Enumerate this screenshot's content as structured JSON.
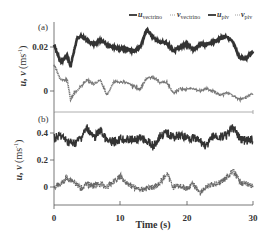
{
  "chart_data": [
    {
      "panel": "(a)",
      "type": "line",
      "title": "",
      "xlabel": "",
      "ylabel": "u, v (ms^-1)",
      "xlim": [
        0,
        30
      ],
      "ylim": [
        -0.01,
        0.037
      ],
      "yticks": [
        0,
        0.02
      ],
      "ytick_labels": [
        "0",
        "0.02"
      ],
      "legend": [
        {
          "name": "u_vectrino",
          "style": "solid-dark"
        },
        {
          "name": "v_vectrino",
          "style": "dotted-light"
        },
        {
          "name": "u_piv",
          "style": "solid-dark"
        },
        {
          "name": "v_piv",
          "style": "dotted-light"
        }
      ],
      "legend_position": "top-right",
      "series": [
        {
          "name": "u",
          "x": [
            0,
            1,
            2,
            2.5,
            3,
            3.5,
            4,
            5,
            6,
            7,
            8,
            9,
            10,
            11,
            12,
            13,
            14,
            15,
            16,
            17,
            18,
            19,
            20,
            21,
            22,
            23,
            24,
            25,
            26,
            27,
            28,
            29,
            30
          ],
          "values": [
            0.021,
            0.013,
            0.016,
            0.011,
            0.018,
            0.024,
            0.025,
            0.023,
            0.021,
            0.023,
            0.021,
            0.02,
            0.019,
            0.019,
            0.018,
            0.02,
            0.028,
            0.024,
            0.022,
            0.022,
            0.018,
            0.02,
            0.021,
            0.019,
            0.021,
            0.021,
            0.022,
            0.024,
            0.025,
            0.022,
            0.015,
            0.015,
            0.018
          ]
        },
        {
          "name": "v",
          "x": [
            0,
            1,
            2,
            2.5,
            3,
            3.5,
            4,
            5,
            6,
            7,
            8,
            9,
            10,
            11,
            12,
            13,
            14,
            15,
            16,
            17,
            18,
            19,
            20,
            21,
            22,
            23,
            24,
            25,
            26,
            27,
            28,
            29,
            30
          ],
          "values": [
            0.012,
            0.005,
            0.005,
            -0.004,
            -0.001,
            0.0,
            0.002,
            0.005,
            0.003,
            0.005,
            -0.002,
            0.004,
            0.004,
            0.004,
            0.002,
            0.001,
            0.006,
            0.006,
            0.004,
            0.004,
            -0.001,
            0.001,
            0.001,
            0.001,
            0.0,
            0.001,
            0.0,
            -0.002,
            -0.001,
            -0.002,
            -0.004,
            -0.003,
            -0.001
          ]
        }
      ]
    },
    {
      "panel": "(b)",
      "type": "line",
      "title": "",
      "xlabel": "Time (s)",
      "ylabel": "u, v (ms^-1)",
      "xlim": [
        0,
        30
      ],
      "xticks": [
        0,
        10,
        20,
        30
      ],
      "xtick_labels": [
        "0",
        "10",
        "20",
        "30"
      ],
      "ylim": [
        -0.14,
        0.56
      ],
      "yticks": [
        0,
        0.2,
        0.4
      ],
      "ytick_labels": [
        "0",
        "0.2",
        "0.4"
      ],
      "series": [
        {
          "name": "u",
          "x": [
            0,
            1,
            2,
            3,
            4,
            5,
            6,
            7,
            8,
            9,
            10,
            11,
            12,
            13,
            14,
            15,
            16,
            17,
            18,
            19,
            20,
            21,
            22,
            23,
            24,
            25,
            26,
            27,
            28,
            29,
            30
          ],
          "values": [
            0.36,
            0.38,
            0.34,
            0.32,
            0.36,
            0.44,
            0.36,
            0.42,
            0.34,
            0.33,
            0.36,
            0.35,
            0.35,
            0.36,
            0.34,
            0.3,
            0.38,
            0.4,
            0.37,
            0.38,
            0.37,
            0.36,
            0.34,
            0.3,
            0.38,
            0.37,
            0.38,
            0.44,
            0.36,
            0.34,
            0.35
          ]
        },
        {
          "name": "v",
          "x": [
            0,
            1,
            2,
            3,
            4,
            5,
            6,
            7,
            8,
            9,
            10,
            11,
            12,
            13,
            14,
            15,
            16,
            17,
            18,
            19,
            20,
            21,
            22,
            23,
            24,
            25,
            26,
            27,
            28,
            29,
            30
          ],
          "values": [
            0.0,
            0.02,
            0.07,
            0.04,
            -0.01,
            0.02,
            0.01,
            0.02,
            0.0,
            0.04,
            0.08,
            0.03,
            0.0,
            -0.02,
            -0.01,
            0.0,
            0.03,
            0.1,
            0.0,
            0.01,
            -0.01,
            0.02,
            -0.04,
            0.0,
            0.02,
            0.03,
            0.07,
            0.12,
            0.04,
            0.02,
            0.01
          ]
        }
      ]
    }
  ],
  "labels": {
    "panel_a": "(a)",
    "panel_b": "(b)",
    "ylabel_main": "u, v",
    "ylabel_unit": "(ms",
    "ylabel_exp": "-1",
    "ylabel_close": ")",
    "xlabel": "Time (s)",
    "legend": [
      {
        "var": "u",
        "sub": "vectrino"
      },
      {
        "var": "v",
        "sub": "vectrino"
      },
      {
        "var": "u",
        "sub": "piv"
      },
      {
        "var": "v",
        "sub": "piv"
      }
    ]
  }
}
